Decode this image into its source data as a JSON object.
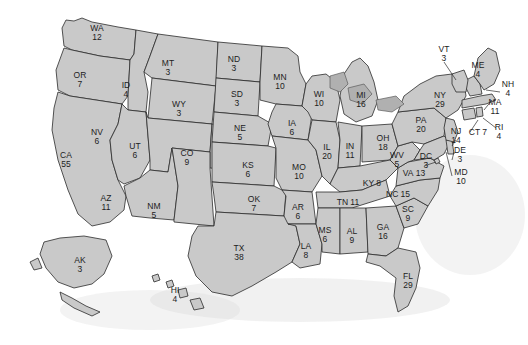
{
  "map": {
    "title": "United States Electoral College Map",
    "colors": {
      "state_fill": "#c9c9c9",
      "state_border": "#2b2b2b",
      "water_fill": "#b0b0b0",
      "background": "#ffffff",
      "label_text": "#1d1d1d"
    },
    "states": [
      {
        "abbr": "WA",
        "votes": "12",
        "x": 97,
        "y": 33,
        "layout": "stack"
      },
      {
        "abbr": "OR",
        "votes": "7",
        "x": 80,
        "y": 80,
        "layout": "stack"
      },
      {
        "abbr": "ID",
        "votes": "4",
        "x": 126,
        "y": 90,
        "layout": "stack"
      },
      {
        "abbr": "MT",
        "votes": "3",
        "x": 168,
        "y": 68,
        "layout": "stack"
      },
      {
        "abbr": "WY",
        "votes": "3",
        "x": 179,
        "y": 109,
        "layout": "stack"
      },
      {
        "abbr": "ND",
        "votes": "3",
        "x": 234,
        "y": 64,
        "layout": "stack"
      },
      {
        "abbr": "SD",
        "votes": "3",
        "x": 237,
        "y": 99,
        "layout": "stack"
      },
      {
        "abbr": "NE",
        "votes": "5",
        "x": 240,
        "y": 133,
        "layout": "stack"
      },
      {
        "abbr": "MN",
        "votes": "10",
        "x": 280,
        "y": 82,
        "layout": "stack"
      },
      {
        "abbr": "IA",
        "votes": "6",
        "x": 292,
        "y": 128,
        "layout": "stack"
      },
      {
        "abbr": "WI",
        "votes": "10",
        "x": 319,
        "y": 99,
        "layout": "stack"
      },
      {
        "abbr": "MI",
        "votes": "16",
        "x": 361,
        "y": 100,
        "layout": "stack"
      },
      {
        "abbr": "NV",
        "votes": "6",
        "x": 97,
        "y": 137,
        "layout": "stack"
      },
      {
        "abbr": "UT",
        "votes": "6",
        "x": 135,
        "y": 151,
        "layout": "stack"
      },
      {
        "abbr": "CA",
        "votes": "55",
        "x": 66,
        "y": 160,
        "layout": "stack"
      },
      {
        "abbr": "CO",
        "votes": "9",
        "x": 187,
        "y": 158,
        "layout": "stack"
      },
      {
        "abbr": "KS",
        "votes": "6",
        "x": 248,
        "y": 170,
        "layout": "stack"
      },
      {
        "abbr": "MO",
        "votes": "10",
        "x": 299,
        "y": 172,
        "layout": "stack"
      },
      {
        "abbr": "IL",
        "votes": "20",
        "x": 327,
        "y": 152,
        "layout": "stack"
      },
      {
        "abbr": "IN",
        "votes": "11",
        "x": 350,
        "y": 151,
        "layout": "stack"
      },
      {
        "abbr": "OH",
        "votes": "18",
        "x": 383,
        "y": 143,
        "layout": "stack"
      },
      {
        "abbr": "AZ",
        "votes": "11",
        "x": 106,
        "y": 203,
        "layout": "stack"
      },
      {
        "abbr": "NM",
        "votes": "5",
        "x": 154,
        "y": 211,
        "layout": "stack"
      },
      {
        "abbr": "OK",
        "votes": "7",
        "x": 254,
        "y": 204,
        "layout": "stack"
      },
      {
        "abbr": "AR",
        "votes": "6",
        "x": 298,
        "y": 212,
        "layout": "stack"
      },
      {
        "abbr": "KY",
        "votes": "8",
        "x": 372,
        "y": 183,
        "layout": "inline"
      },
      {
        "abbr": "TN",
        "votes": "11",
        "x": 348,
        "y": 202,
        "layout": "inline"
      },
      {
        "abbr": "TX",
        "votes": "38",
        "x": 239,
        "y": 253,
        "layout": "stack"
      },
      {
        "abbr": "LA",
        "votes": "8",
        "x": 306,
        "y": 251,
        "layout": "stack"
      },
      {
        "abbr": "MS",
        "votes": "6",
        "x": 325,
        "y": 235,
        "layout": "stack"
      },
      {
        "abbr": "AL",
        "votes": "9",
        "x": 352,
        "y": 236,
        "layout": "stack"
      },
      {
        "abbr": "GA",
        "votes": "16",
        "x": 383,
        "y": 232,
        "layout": "stack"
      },
      {
        "abbr": "FL",
        "votes": "29",
        "x": 408,
        "y": 281,
        "layout": "stack"
      },
      {
        "abbr": "SC",
        "votes": "9",
        "x": 408,
        "y": 214,
        "layout": "stack"
      },
      {
        "abbr": "NC",
        "votes": "15",
        "x": 398,
        "y": 194,
        "layout": "inline"
      },
      {
        "abbr": "VA",
        "votes": "13",
        "x": 414,
        "y": 173,
        "layout": "inline"
      },
      {
        "abbr": "WV",
        "votes": "5",
        "x": 397,
        "y": 160,
        "layout": "stack"
      },
      {
        "abbr": "DC",
        "votes": "3",
        "x": 426,
        "y": 161,
        "layout": "stack"
      },
      {
        "abbr": "MD",
        "votes": "10",
        "x": 461,
        "y": 177,
        "layout": "stack"
      },
      {
        "abbr": "DE",
        "votes": "3",
        "x": 460,
        "y": 155,
        "layout": "stack"
      },
      {
        "abbr": "NJ",
        "votes": "14",
        "x": 456,
        "y": 136,
        "layout": "stack"
      },
      {
        "abbr": "PA",
        "votes": "20",
        "x": 421,
        "y": 125,
        "layout": "stack"
      },
      {
        "abbr": "NY",
        "votes": "29",
        "x": 440,
        "y": 100,
        "layout": "stack"
      },
      {
        "abbr": "CT",
        "votes": "7",
        "x": 478,
        "y": 132,
        "layout": "inline"
      },
      {
        "abbr": "RI",
        "votes": "4",
        "x": 499,
        "y": 132,
        "layout": "stack"
      },
      {
        "abbr": "MA",
        "votes": "11",
        "x": 495,
        "y": 107,
        "layout": "stack"
      },
      {
        "abbr": "NH",
        "votes": "4",
        "x": 508,
        "y": 89,
        "layout": "stack"
      },
      {
        "abbr": "VT",
        "votes": "3",
        "x": 444,
        "y": 54,
        "layout": "stack"
      },
      {
        "abbr": "ME",
        "votes": "4",
        "x": 478,
        "y": 70,
        "layout": "stack"
      },
      {
        "abbr": "AK",
        "votes": "3",
        "x": 80,
        "y": 265,
        "layout": "stack"
      },
      {
        "abbr": "HI",
        "votes": "4",
        "x": 175,
        "y": 295,
        "layout": "stack"
      }
    ]
  }
}
